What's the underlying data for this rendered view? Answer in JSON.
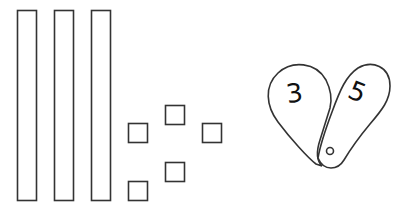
{
  "diagram": {
    "colors": {
      "stroke": "#333333",
      "fill": "#ffffff",
      "text": "#111111"
    },
    "tens_rods": [
      {
        "x": 17,
        "y": 10,
        "w": 19,
        "h": 190
      },
      {
        "x": 54,
        "y": 10,
        "w": 19,
        "h": 190
      },
      {
        "x": 91,
        "y": 10,
        "w": 19,
        "h": 190
      }
    ],
    "unit_cubes": [
      {
        "x": 128,
        "y": 123,
        "s": 20
      },
      {
        "x": 165,
        "y": 105,
        "s": 20
      },
      {
        "x": 202,
        "y": 123,
        "s": 20
      },
      {
        "x": 165,
        "y": 162,
        "s": 20
      },
      {
        "x": 128,
        "y": 181,
        "s": 20
      }
    ],
    "number_fan": {
      "left_card": {
        "digit": "3"
      },
      "right_card": {
        "digit": "5"
      }
    }
  }
}
